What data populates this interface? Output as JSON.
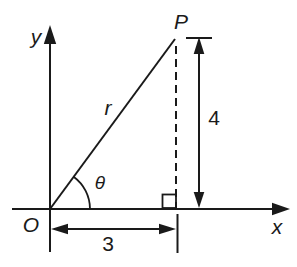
{
  "figure": {
    "type": "right-triangle-coordinate-diagram",
    "background_color": "#ffffff",
    "line_color": "#1a1a1a",
    "labels": {
      "y_axis": "y",
      "x_axis": "x",
      "origin": "O",
      "point": "P",
      "hypotenuse": "r",
      "angle": "θ"
    },
    "dimensions": {
      "horizontal_leg": "3",
      "vertical_leg": "4"
    }
  }
}
